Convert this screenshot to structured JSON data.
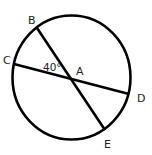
{
  "diagram": {
    "type": "circle-geometry",
    "circle": {
      "center_label": "A"
    },
    "points": [
      {
        "id": "A",
        "label": "A"
      },
      {
        "id": "B",
        "label": "B"
      },
      {
        "id": "C",
        "label": "C"
      },
      {
        "id": "D",
        "label": "D"
      },
      {
        "id": "E",
        "label": "E"
      }
    ],
    "segments": [
      {
        "from": "B",
        "to": "E",
        "label": "BE"
      },
      {
        "from": "C",
        "to": "D",
        "label": "CD"
      }
    ],
    "angle": {
      "vertex": "A",
      "between": [
        "C",
        "B"
      ],
      "label": "40°"
    },
    "colors": {
      "stroke": "#000000",
      "text": "#222222",
      "background": "#ffffff"
    }
  }
}
